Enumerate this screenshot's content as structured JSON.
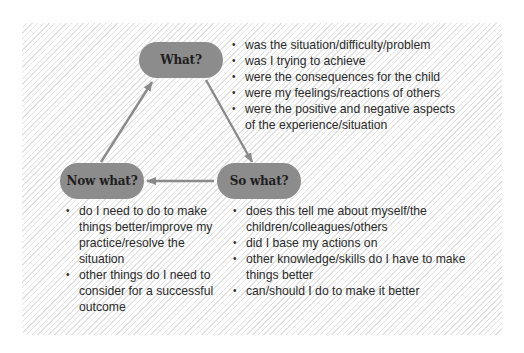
{
  "diagram": {
    "type": "reflective-cycle",
    "colors": {
      "node_fill": "#8c8c8c",
      "node_text": "#1e1e1e",
      "arrow": "#8a8a8a",
      "text": "#2a2a2a",
      "panel_bg": "#f6f6f6"
    },
    "nodes": {
      "what": {
        "label": "What?",
        "items": [
          "was the situation/difficulty/problem",
          "was I trying to achieve",
          "were the consequences for the child",
          "were my feelings/reactions of others",
          "were the positive and negative aspects of the experience/situation"
        ]
      },
      "so_what": {
        "label": "So what?",
        "items": [
          "does this tell me about myself/the children/colleagues/others",
          "did I base my actions on",
          "other knowledge/skills do I have to make things better",
          "can/should I do to make it better"
        ]
      },
      "now_what": {
        "label": "Now what?",
        "items": [
          "do I need to do to make things better/improve my practice/resolve the situation",
          "other things do I need to consider for a successful outcome"
        ]
      }
    },
    "edges": [
      {
        "from": "What?",
        "to": "So what?"
      },
      {
        "from": "So what?",
        "to": "Now what?"
      },
      {
        "from": "Now what?",
        "to": "What?"
      }
    ],
    "bullet_glyph": "•"
  }
}
